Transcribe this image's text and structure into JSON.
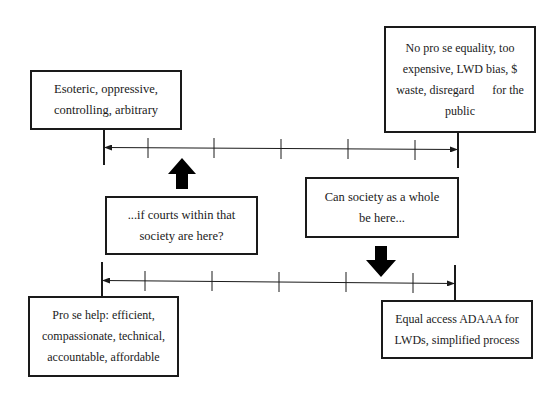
{
  "diagram": {
    "colors": {
      "stroke": "#1a1a1a",
      "background": "#ffffff"
    },
    "top_scale": {
      "left_label": {
        "lines": [
          "Esoteric, oppressive,",
          "controlling, arbitrary"
        ]
      },
      "right_label": {
        "lines": [
          "No pro se equality, too",
          "expensive, LWD bias, $",
          "waste, disregard      for the",
          "public"
        ]
      },
      "tick_count": 5
    },
    "bottom_scale": {
      "left_label": {
        "lines": [
          "Pro se help: efficient,",
          "compassionate, technical,",
          "accountable, affordable"
        ]
      },
      "right_label": {
        "lines": [
          "Equal access ADAAA for",
          "LWDs, simplified process"
        ]
      },
      "tick_count": 5
    },
    "annotations": {
      "courts_question": {
        "lines": [
          "...if courts within that",
          "society are here?"
        ],
        "arrow": "up-arrow"
      },
      "society_question": {
        "lines": [
          "Can society as a whole",
          "be here..."
        ],
        "arrow": "down-arrow"
      }
    }
  }
}
